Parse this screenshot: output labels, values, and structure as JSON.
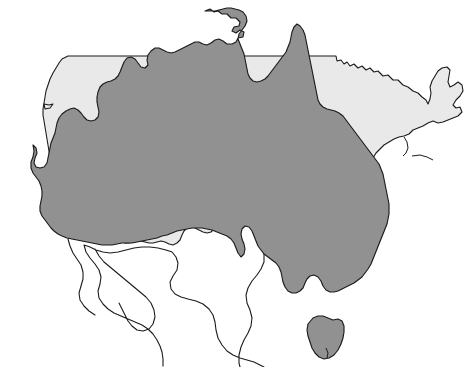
{
  "figure": {
    "type": "map-overlay",
    "width": 474,
    "height": 367,
    "background_color": "#ffffff"
  },
  "colors": {
    "background": "#ffffff",
    "usa_fill": "#e9e9e9",
    "australia_fill": "#919191",
    "neighbor_fill": "#ffffff",
    "outline": "#1b1b1b"
  },
  "layers": [
    {
      "id": "neighbors",
      "name": "Surrounding landmasses (unfilled outlines)",
      "fill": "#ffffff",
      "stroke": "#1b1b1b",
      "z": 1,
      "features": [
        {
          "name": "Mexico",
          "label": "Mexico"
        },
        {
          "name": "Baja California",
          "label": "Baja California"
        }
      ]
    },
    {
      "id": "usa",
      "name": "Contiguous United States",
      "fill": "#e9e9e9",
      "stroke": "#1b1b1b",
      "z": 2,
      "features": [
        {
          "name": "Contiguous United States",
          "label": "Contiguous United States"
        }
      ]
    },
    {
      "id": "australia",
      "name": "Australia",
      "fill": "#919191",
      "stroke": "#1b1b1b",
      "z": 3,
      "features": [
        {
          "name": "Australian mainland",
          "label": "Australia"
        },
        {
          "name": "Tasmania",
          "label": "Tasmania"
        }
      ]
    }
  ],
  "annotations": {
    "has_text_labels": false,
    "has_legend": false,
    "has_scale_bar": false,
    "has_graticule": false,
    "has_compass_rose": false,
    "notes": "No visible text, legend, axis, or scale markings appear anywhere in the image."
  },
  "geometry": {
    "usa_outline": "M 64,57 L 334,57 L 333,60 L 336,62 L 340,61 L 345,64 L 349,62 L 352,66 L 358,66 L 362,63 L 366,67 L 370,66 L 375,70 L 380,68 L 386,73 L 392,72 L 398,77 L 404,77 L 410,82 L 416,83 L 421,88 L 427,89 L 431,94 L 437,96 L 440,92 L 443,86 L 441,80 L 444,74 L 449,72 L 452,77 L 451,83 L 454,86 L 458,83 L 462,86 L 460,92 L 463,96 L 461,101 L 457,104 L 458,109 L 454,113 L 455,118 L 451,120 L 452,125 L 448,127 L 444,124 L 440,127 L 436,125 L 432,129 L 434,134 L 430,137 L 426,135 L 422,139 L 418,137 L 414,141 L 409,139 L 405,143 L 400,142 L 396,147 L 391,146 L 387,151 L 382,151 L 378,156 L 374,156 L 371,161 L 367,163 L 364,168 L 361,174 L 358,180 L 356,187 L 353,193 L 351,200 L 348,206 L 346,213 L 344,220 L 341,226 L 339,233 L 337,240 L 334,246 L 331,252 L 327,256 L 322,258 L 317,256 L 313,252 L 310,247 L 307,242 L 304,237 L 300,234 L 296,236 L 293,240 L 291,246 L 289,252 L 286,257 L 282,260 L 277,259 L 273,256 L 269,252 L 265,249 L 260,248 L 255,250 L 250,252 L 245,253 L 240,251 L 236,248 L 231,247 L 226,249 L 221,251 L 216,252 L 211,251 L 206,249 L 201,248 L 196,249 L 191,251 L 186,253 L 181,254 L 176,253 L 171,251 L 166,249 L 161,248 L 156,249 L 151,250 L 146,249 L 141,247 L 136,245 L 131,244 L 126,245 L 121,246 L 116,244 L 112,240 L 109,235 L 106,230 L 103,225 L 100,220 L 97,215 L 94,210 L 91,205 L 88,200 L 86,195 L 84,189 L 82,183 L 80,177 L 78,171 L 76,165 L 74,159 L 72,153 L 70,147 L 68,141 L 66,135 L 64,129 L 62,123 L 60,117 L 58,111 L 56,105 L 54,99 L 52,93 L 50,87 L 48,81 L 46,75 L 48,69 L 52,64 L 58,60 Z",
    "australia_outline": "M 145,107 L 175,88 L 205,75 L 235,63 L 260,48 L 275,38 L 295,32 L 320,30 L 340,40 L 360,55 L 390,70 L 420,95 L 440,130 L 450,170 L 440,215 L 420,250 L 390,280 L 350,300 L 300,305 L 250,295 L 210,275 L 175,250 L 155,215 L 145,175 L 140,140 Z",
    "tasmania_outline": "M 314,317 L 324,316 L 332,320 L 340,318 L 344,323 L 343,333 L 340,343 L 335,352 L 329,358 L 322,359 L 316,354 L 311,346 L 308,337 L 308,327 Z"
  }
}
